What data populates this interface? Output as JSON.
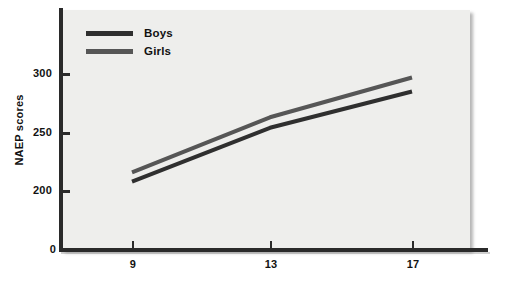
{
  "chart_data": {
    "type": "line",
    "title": "",
    "xlabel": "",
    "ylabel": "NAEP scores",
    "categories": [
      "9",
      "13",
      "17"
    ],
    "x": [
      9,
      13,
      17
    ],
    "xlim": [
      7,
      19
    ],
    "ylim": [
      0,
      320
    ],
    "grid": false,
    "legend_position": "top-left",
    "series": [
      {
        "name": "Boys",
        "color": "#2f2f2f",
        "values": [
          208,
          254,
          285
        ]
      },
      {
        "name": "Girls",
        "color": "#565656",
        "values": [
          216,
          263,
          297
        ]
      }
    ]
  },
  "axes": {
    "y_ticks": [
      {
        "label": "300",
        "value": 300
      },
      {
        "label": "250",
        "value": 250
      },
      {
        "label": "200",
        "value": 200
      },
      {
        "label": "0",
        "value": 0
      }
    ],
    "x_ticks": [
      {
        "label": "9",
        "value": 9
      },
      {
        "label": "13",
        "value": 13
      },
      {
        "label": "17",
        "value": 17
      }
    ],
    "y_title": "NAEP scores"
  },
  "legend": {
    "items": [
      {
        "label": "Boys",
        "color": "#2f2f2f"
      },
      {
        "label": "Girls",
        "color": "#565656"
      }
    ]
  },
  "colors": {
    "panel_background": "#eeeeec",
    "axis": "#2a2a2a",
    "text": "#121212",
    "boys_line": "#2f2f2f",
    "girls_line": "#565656"
  }
}
